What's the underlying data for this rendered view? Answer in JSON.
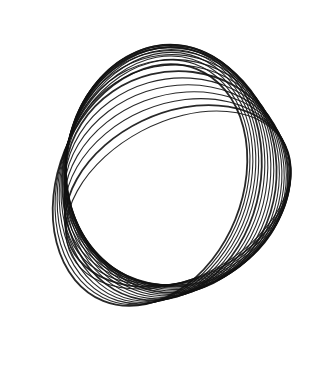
{
  "image": {
    "description": "Black ink line drawing of many overlapping rotated ellipses forming a twisted loop (harmonograph-like)",
    "background": "#ffffff",
    "stroke": "#111111"
  },
  "loops": {
    "count": 22,
    "start": {
      "cx": 150,
      "cy": 185,
      "rx": 92,
      "ry": 125,
      "rot": 22
    },
    "end": {
      "cx": 178,
      "cy": 200,
      "rx": 120,
      "ry": 78,
      "rot": -28
    }
  }
}
